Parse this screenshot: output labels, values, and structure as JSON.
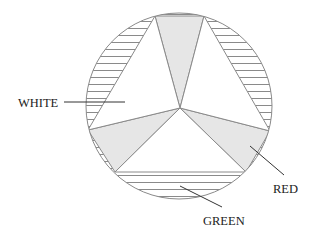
{
  "diagram": {
    "colors": {
      "stroke": "#8a8a8a",
      "gray_fill": "#e6e6e6",
      "white_fill": "#ffffff",
      "hatch": "#8a8a8a",
      "leader": "#333333",
      "text": "#222222"
    },
    "labels": {
      "white": "WHITE",
      "red": "RED",
      "green": "GREEN"
    }
  }
}
